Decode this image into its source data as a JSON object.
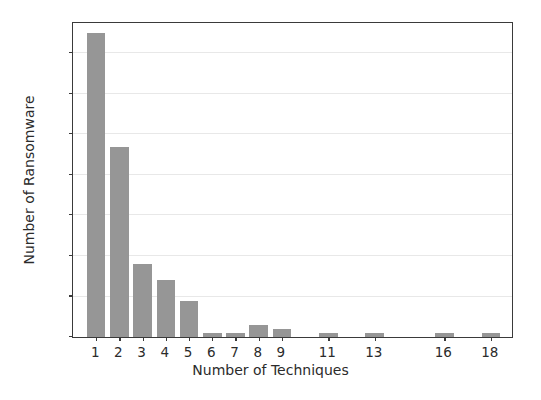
{
  "chart_data": {
    "type": "bar",
    "title": "",
    "xlabel": "Number of Techniques",
    "ylabel": "Number of Ransomware",
    "categories": [
      1,
      2,
      3,
      4,
      5,
      6,
      7,
      8,
      9,
      11,
      13,
      16,
      18
    ],
    "values": [
      75,
      47,
      18,
      14,
      9,
      1,
      1,
      3,
      2,
      1,
      1,
      1,
      1
    ],
    "xlim": [
      0,
      19
    ],
    "ylim": [
      0,
      78
    ],
    "xticks": [
      1,
      2,
      3,
      4,
      5,
      6,
      7,
      8,
      9,
      11,
      13,
      16,
      18
    ],
    "xtick_labels": [
      "1",
      "2",
      "3",
      "4",
      "5",
      "6",
      "7",
      "8",
      "9",
      "11",
      "13",
      "16",
      "18"
    ],
    "yticks": [
      0,
      10,
      20,
      30,
      40,
      50,
      60,
      70
    ],
    "ytick_labels": [
      "0",
      "10",
      "20",
      "30",
      "40",
      "50",
      "60",
      "70"
    ],
    "grid": true,
    "grid_axis": "y",
    "legend": null,
    "bar_color": "#969696",
    "grid_color": "#e8e8e8",
    "axis_color": "#3a3a3a",
    "background_color": "#ffffff",
    "bar_width": 0.8
  }
}
